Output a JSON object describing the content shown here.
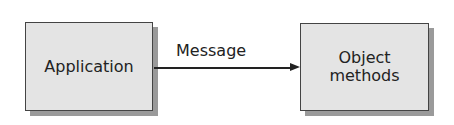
{
  "diagram": {
    "nodes": [
      {
        "id": "application",
        "label": "Application"
      },
      {
        "id": "object_methods",
        "label": "Object\nmethods",
        "line1": "Object",
        "line2": "methods"
      }
    ],
    "edges": [
      {
        "from": "application",
        "to": "object_methods",
        "label": "Message"
      }
    ]
  }
}
